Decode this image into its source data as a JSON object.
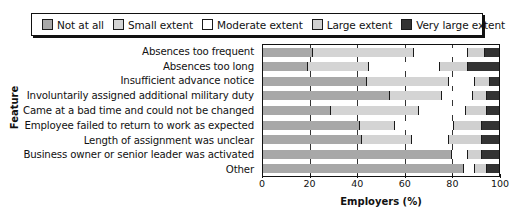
{
  "chart_data": {
    "type": "bar",
    "orientation": "horizontal",
    "stacked": true,
    "title": "",
    "xlabel": "Employers (%)",
    "ylabel": "Feature",
    "xlim": [
      0,
      100
    ],
    "xticks": [
      0,
      20,
      40,
      60,
      80,
      100
    ],
    "grid": true,
    "legend_position": "top",
    "categories": [
      "Absences too frequent",
      "Absences too long",
      "Insufficient advance notice",
      "Involuntarily assigned additional military duty",
      "Came at a bad time and could not be changed",
      "Employee failed to return to work as expected",
      "Length of assignment was unclear",
      "Business owner or senior leader was activated",
      "Other"
    ],
    "series": [
      {
        "name": "Not at all",
        "color": "#a8a8a8",
        "values": [
          21,
          19,
          44,
          54,
          29,
          41,
          42,
          80,
          85
        ]
      },
      {
        "name": "Small extent",
        "color": "#d4d4d4",
        "values": [
          43,
          26,
          35,
          22,
          37,
          15,
          21,
          0,
          0
        ]
      },
      {
        "name": "Moderate extent",
        "color": "#ffffff",
        "values": [
          23,
          30,
          11,
          13,
          20,
          25,
          16,
          7,
          5
        ]
      },
      {
        "name": "Large extent",
        "color": "#d0d0d0",
        "values": [
          7,
          12,
          6,
          6,
          9,
          12,
          14,
          6,
          5
        ]
      },
      {
        "name": "Very large extent",
        "color": "#333333",
        "values": [
          6,
          13,
          4,
          5,
          5,
          7,
          7,
          7,
          5
        ]
      }
    ]
  },
  "legend": {
    "items": [
      {
        "label": "Not at all",
        "color": "#a8a8a8"
      },
      {
        "label": "Small extent",
        "color": "#d4d4d4"
      },
      {
        "label": "Moderate extent",
        "color": "#ffffff"
      },
      {
        "label": "Large extent",
        "color": "#d0d0d0"
      },
      {
        "label": "Very large extent",
        "color": "#333333"
      }
    ]
  }
}
